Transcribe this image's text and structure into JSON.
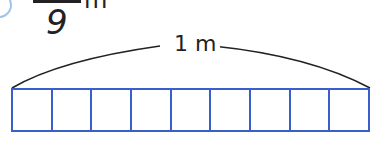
{
  "fraction": {
    "denominator": "9",
    "unit": "m"
  },
  "brace_label": "1 m",
  "bar": {
    "cells": 9,
    "stroke_color": "#3b5fc9"
  },
  "colors": {
    "text": "#222222",
    "circle": "#9fc4e8",
    "bar": "#3b5fc9"
  }
}
